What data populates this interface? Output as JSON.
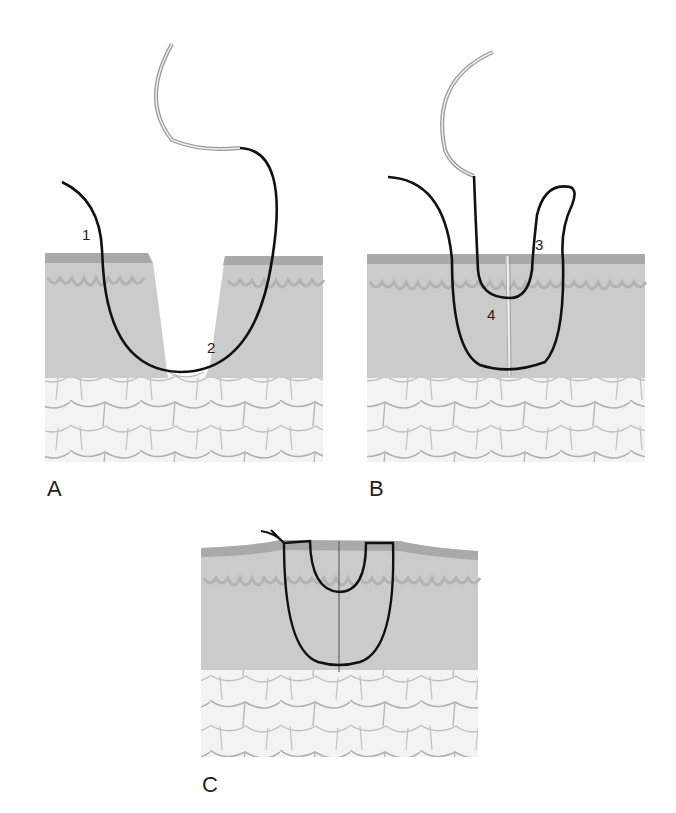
{
  "figure": {
    "colors": {
      "epidermis": "#a8a8a8",
      "dermis": "#c9c9c9",
      "fat": "#f1f1f1",
      "fat_outline": "#a6a6a6",
      "suture": "#111111",
      "needle": "#9a9a9a"
    }
  },
  "panels": [
    {
      "id": "A",
      "label": "A",
      "step_labels": [
        "1",
        "2"
      ]
    },
    {
      "id": "B",
      "label": "B",
      "step_labels": [
        "3",
        "4"
      ]
    },
    {
      "id": "C",
      "label": "C",
      "step_labels": []
    }
  ]
}
